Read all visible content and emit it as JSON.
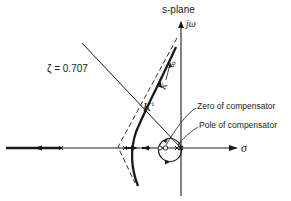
{
  "diagram": {
    "title": "s-plane",
    "axes": {
      "imaginary_label": "jω",
      "real_label": "σ"
    },
    "damping_line_label": "ζ = 0.707",
    "gain_point_label": "K",
    "gain_point_superscript": "1",
    "branch_gain_label": "K",
    "branch_end_label": "∞",
    "annotations": [
      {
        "label": "Zero of compensator"
      },
      {
        "label": "Pole of compensator"
      }
    ],
    "colors": {
      "ink": "#1a1a1a",
      "background": "#ffffff"
    }
  }
}
